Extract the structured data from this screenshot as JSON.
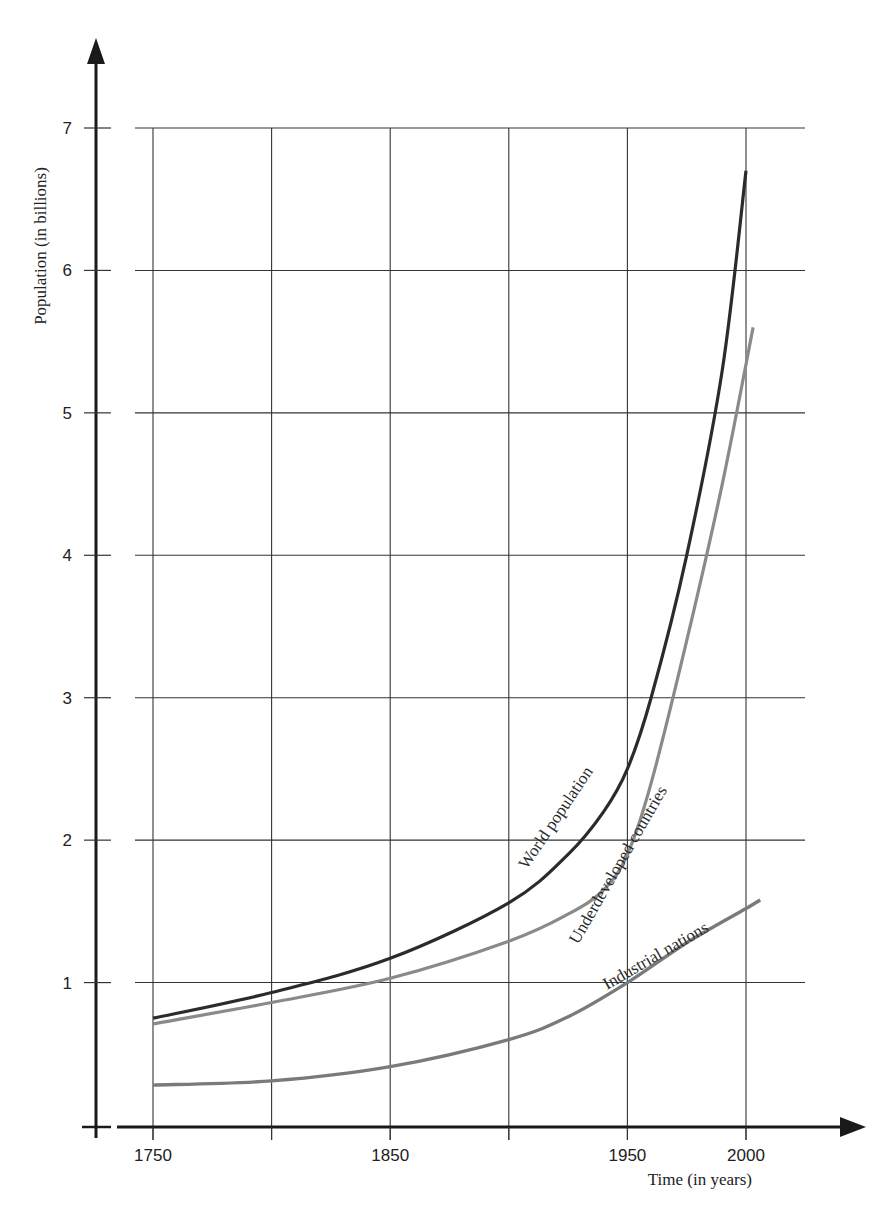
{
  "chart_data": {
    "type": "line",
    "title": "",
    "xlabel": "Time (in years)",
    "ylabel": "Population (in billions)",
    "xlim": [
      1750,
      2000
    ],
    "ylim": [
      0,
      7
    ],
    "grid": true,
    "legend": "inline labels along curves",
    "x_tick_labels": [
      "1750",
      "1850",
      "1950",
      "2000"
    ],
    "x_gridlines": [
      1750,
      1800,
      1850,
      1900,
      1950,
      2000
    ],
    "y_tick_labels": [
      "1",
      "2",
      "3",
      "4",
      "5",
      "6",
      "7"
    ],
    "y_ticks": [
      1,
      2,
      3,
      4,
      5,
      6,
      7
    ],
    "series": [
      {
        "name": "World population",
        "color": "#2b2b2b",
        "x": [
          1750,
          1800,
          1850,
          1900,
          1925,
          1940,
          1950,
          1960,
          1975,
          1990,
          2000
        ],
        "values": [
          0.75,
          0.93,
          1.17,
          1.56,
          1.9,
          2.2,
          2.5,
          3.0,
          4.0,
          5.3,
          6.7
        ]
      },
      {
        "name": "Underdeveloped countries",
        "color": "#8a8a8a",
        "x": [
          1750,
          1800,
          1850,
          1900,
          1925,
          1940,
          1950,
          1960,
          1975,
          1990,
          2003
        ],
        "values": [
          0.71,
          0.86,
          1.03,
          1.29,
          1.48,
          1.65,
          1.9,
          2.4,
          3.4,
          4.5,
          5.6
        ]
      },
      {
        "name": "Industrial nations",
        "color": "#7a7a7a",
        "x": [
          1750,
          1800,
          1850,
          1900,
          1925,
          1950,
          1975,
          2000,
          2006
        ],
        "values": [
          0.28,
          0.31,
          0.41,
          0.6,
          0.76,
          1.0,
          1.28,
          1.52,
          1.58
        ]
      }
    ]
  }
}
